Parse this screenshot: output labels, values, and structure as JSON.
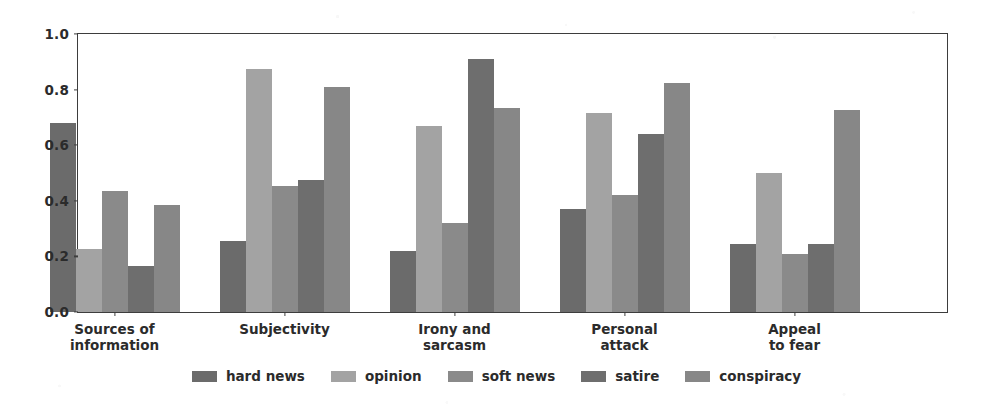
{
  "chart_data": {
    "type": "bar",
    "title": "",
    "xlabel": "",
    "ylabel": "",
    "ylim": [
      0.0,
      1.0
    ],
    "grid": false,
    "legend_position": "bottom-center",
    "orientation": "vertical",
    "grouping": "grouped",
    "categories": [
      "Sources of\ninformation",
      "Subjectivity",
      "Irony and\nsarcasm",
      "Personal\nattack",
      "Appeal\nto fear"
    ],
    "ytick_labels": [
      "0.0",
      "0.2",
      "0.4",
      "0.6",
      "0.8",
      "1.0"
    ],
    "ytick_values": [
      0.0,
      0.2,
      0.4,
      0.6,
      0.8,
      1.0
    ],
    "series": [
      {
        "name": "hard news",
        "color": "#6b6b6b",
        "values": [
          0.68,
          0.255,
          0.22,
          0.37,
          0.245
        ]
      },
      {
        "name": "opinion",
        "color": "#a3a3a3",
        "values": [
          0.225,
          0.875,
          0.67,
          0.715,
          0.5
        ]
      },
      {
        "name": "soft news",
        "color": "#8a8a8a",
        "values": [
          0.435,
          0.455,
          0.32,
          0.42,
          0.21
        ]
      },
      {
        "name": "satire",
        "color": "#6e6e6e",
        "values": [
          0.165,
          0.475,
          0.91,
          0.64,
          0.245
        ]
      },
      {
        "name": "conspiracy",
        "color": "#878787",
        "values": [
          0.385,
          0.81,
          0.735,
          0.825,
          0.725
        ]
      }
    ]
  },
  "legend": {
    "entries": [
      {
        "label": "hard news",
        "color": "#6b6b6b"
      },
      {
        "label": "opinion",
        "color": "#a3a3a3"
      },
      {
        "label": "soft news",
        "color": "#8a8a8a"
      },
      {
        "label": "satire",
        "color": "#6e6e6e"
      },
      {
        "label": "conspiracy",
        "color": "#878787"
      }
    ]
  },
  "axes": {
    "frame_color": "#3d3d3d",
    "tick_label_color": "#2b2b2b"
  }
}
